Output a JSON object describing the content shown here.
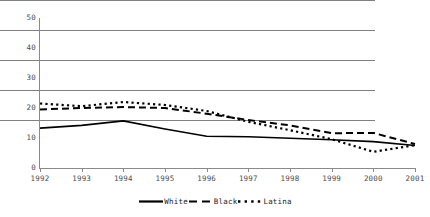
{
  "chart_data": {
    "type": "line",
    "title": "",
    "xlabel": "",
    "ylabel": "",
    "categories": [
      "1992",
      "1993",
      "1994",
      "1995",
      "1996",
      "1997",
      "1998",
      "1999",
      "2000",
      "2001"
    ],
    "x": [
      1992,
      1993,
      1994,
      1995,
      1996,
      1997,
      1998,
      1999,
      2000,
      2001
    ],
    "ylim": [
      0,
      50
    ],
    "yticks": [
      0,
      10,
      20,
      30,
      40,
      50
    ],
    "grid": true,
    "legend_position": "bottom",
    "series": [
      {
        "name": "White",
        "style": "solid",
        "color": "#000000",
        "values": [
          13.3,
          14.2,
          15.7,
          13.0,
          10.6,
          10.4,
          9.9,
          9.4,
          8.8,
          7.5
        ]
      },
      {
        "name": "Black",
        "style": "dashed",
        "color": "#000000",
        "values": [
          19.5,
          20.0,
          20.3,
          20.0,
          18.1,
          16.0,
          14.2,
          11.6,
          11.7,
          8.0
        ]
      },
      {
        "name": "Latina",
        "style": "dotted",
        "color": "#000000",
        "values": [
          21.5,
          20.6,
          22.0,
          21.0,
          19.0,
          15.4,
          12.6,
          9.6,
          5.4,
          7.6
        ]
      }
    ]
  },
  "axes": {
    "y_tick_labels": [
      "50",
      "40",
      "30",
      "20",
      "10",
      "0"
    ],
    "x_tick_labels": [
      "1992",
      "1993",
      "1994",
      "1995",
      "1996",
      "1997",
      "1998",
      "1999",
      "2000",
      "2001"
    ]
  },
  "legend": {
    "items": [
      {
        "label": "White",
        "style": "solid"
      },
      {
        "label": "Black",
        "style": "dashed"
      },
      {
        "label": "Latina",
        "style": "dotted"
      }
    ]
  },
  "colors": {
    "grid": "#808080",
    "axis": "#8a8a8a",
    "series": "#000000",
    "tick_text": "#4d4d4d"
  }
}
